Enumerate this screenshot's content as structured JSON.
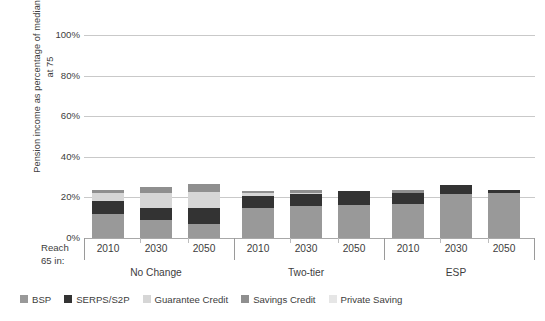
{
  "chart_data": {
    "type": "bar",
    "subtype": "stacked-bar",
    "title": "",
    "xlabel": "Reach 65 in:",
    "ylabel": "Pension income as percentage of median earnings at 75",
    "ylim": [
      0,
      100
    ],
    "yticks": [
      "0%",
      "20%",
      "40%",
      "60%",
      "80%",
      "100%"
    ],
    "ytick_values": [
      0,
      20,
      40,
      60,
      80,
      100
    ],
    "grid": true,
    "legend_position": "bottom",
    "groups": [
      "No Change",
      "Two-tier",
      "ESP"
    ],
    "categories": [
      "2010",
      "2030",
      "2050",
      "2010",
      "2030",
      "2050",
      "2010",
      "2030",
      "2050"
    ],
    "series": [
      {
        "name": "BSP",
        "color": "#999999",
        "values": [
          12.0,
          9.0,
          7.0,
          15.0,
          16.0,
          16.5,
          17.0,
          21.5,
          22.0
        ]
      },
      {
        "name": "SERPS/S2P",
        "color": "#333333",
        "values": [
          6.0,
          6.0,
          8.0,
          5.5,
          5.5,
          6.5,
          5.0,
          4.5,
          1.5
        ]
      },
      {
        "name": "Guarantee Credit",
        "color": "#d6d6d6",
        "values": [
          4.0,
          7.0,
          7.5,
          1.5,
          0.5,
          0.0,
          0.0,
          0.0,
          0.0
        ]
      },
      {
        "name": "Savings Credit",
        "color": "#8f8f8f",
        "values": [
          1.5,
          3.0,
          4.0,
          1.0,
          1.5,
          0.0,
          1.5,
          0.0,
          0.0
        ]
      },
      {
        "name": "Private Saving",
        "color": "#e6e6e6",
        "values": [
          0.0,
          0.0,
          0.0,
          0.0,
          0.0,
          0.0,
          0.0,
          0.0,
          0.0
        ]
      }
    ],
    "totals": [
      23.5,
      25.0,
      26.5,
      23.0,
      23.5,
      23.0,
      23.5,
      26.0,
      23.5
    ]
  },
  "axis": {
    "y_title": "Pension income as percentage of median earnings at 75",
    "reach_label_line1": "Reach",
    "reach_label_line2": "65 in:"
  },
  "legend": {
    "items": [
      {
        "label": "BSP",
        "color": "#999999"
      },
      {
        "label": "SERPS/S2P",
        "color": "#333333"
      },
      {
        "label": "Guarantee Credit",
        "color": "#d6d6d6"
      },
      {
        "label": "Savings Credit",
        "color": "#8f8f8f"
      },
      {
        "label": "Private Saving",
        "color": "#e6e6e6"
      }
    ]
  }
}
